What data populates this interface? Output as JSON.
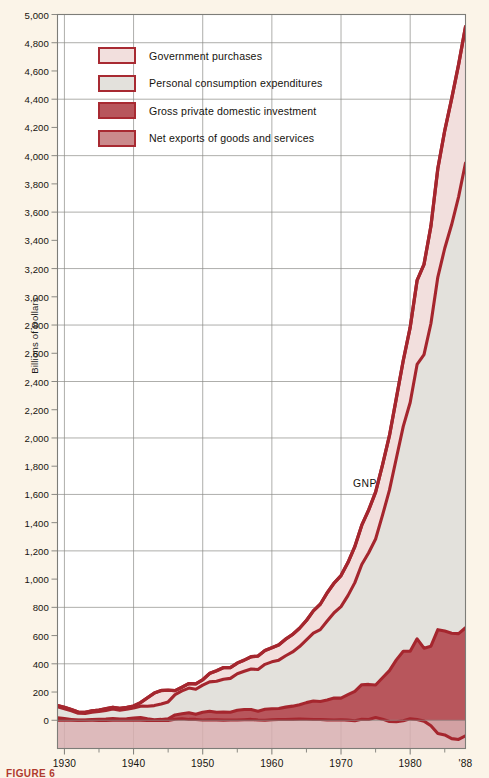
{
  "figure": {
    "caption": "FIGURE 6",
    "background_color": "#fbf4e8",
    "plot_background_color": "#ffffff"
  },
  "legend": {
    "items": [
      {
        "label": "Government purchases",
        "fill": "#f2dfdd",
        "border": "#a82a32"
      },
      {
        "label": "Personal consumption expenditures",
        "fill": "#e3e1dc",
        "border": "#a82a32"
      },
      {
        "label": "Gross private domestic investment",
        "fill": "#b8565c",
        "border": "#a82a32"
      },
      {
        "label": "Net exports of goods and services",
        "fill": "#cb8a8c",
        "border": "#a82a32"
      }
    ]
  },
  "annotations": [
    {
      "name": "gnp-label",
      "text": "GNP",
      "x": 353,
      "y": 478
    }
  ],
  "chart_data": {
    "type": "area",
    "title": "",
    "subtitle": "",
    "xlabel": "",
    "ylabel": "Billions of Dollars",
    "xlim": [
      1929,
      1988
    ],
    "ylim": [
      -200,
      5000
    ],
    "grid": true,
    "legend_position": "inside-top-left",
    "y_ticks": [
      0,
      200,
      400,
      600,
      800,
      1000,
      1200,
      1400,
      1600,
      1800,
      2000,
      2200,
      2400,
      2600,
      2800,
      3000,
      3200,
      3400,
      3600,
      3800,
      4000,
      4200,
      4400,
      4600,
      4800,
      5000
    ],
    "y_tick_labels": [
      "0",
      "200",
      "400",
      "600",
      "800",
      "1,000",
      "1,200",
      "1,400",
      "1,600",
      "1,800",
      "2,000",
      "2,200",
      "2,400",
      "2,600",
      "2,800",
      "3,000",
      "3,200",
      "3,400",
      "3,600",
      "3,800",
      "4,000",
      "4,200",
      "4,400",
      "4,600",
      "4,800",
      "5,000"
    ],
    "x_ticks": [
      1930,
      1940,
      1950,
      1960,
      1970,
      1980,
      1988
    ],
    "x_tick_labels": [
      "1930",
      "1940",
      "1950",
      "1960",
      "1970",
      "1980",
      "'88"
    ],
    "x_minor_ticks": [
      1935,
      1945,
      1955,
      1965,
      1975,
      1985
    ],
    "x": [
      1929,
      1930,
      1931,
      1932,
      1933,
      1934,
      1935,
      1936,
      1937,
      1938,
      1939,
      1940,
      1941,
      1942,
      1943,
      1944,
      1945,
      1946,
      1947,
      1948,
      1949,
      1950,
      1951,
      1952,
      1953,
      1954,
      1955,
      1956,
      1957,
      1958,
      1959,
      1960,
      1961,
      1962,
      1963,
      1964,
      1965,
      1966,
      1967,
      1968,
      1969,
      1970,
      1971,
      1972,
      1973,
      1974,
      1975,
      1976,
      1977,
      1978,
      1979,
      1980,
      1981,
      1982,
      1983,
      1984,
      1985,
      1986,
      1987,
      1988
    ],
    "series": [
      {
        "name": "Net exports of goods and services",
        "order": 1,
        "fill": "#cb8a8c",
        "line": "#a5262e",
        "values": [
          1,
          1,
          0,
          0,
          0,
          1,
          -1,
          -1,
          1,
          1,
          1,
          2,
          1,
          -1,
          -2,
          -2,
          -1,
          7,
          11,
          6,
          6,
          2,
          4,
          3,
          1,
          2,
          2,
          4,
          6,
          2,
          0,
          4,
          5,
          5,
          6,
          8,
          7,
          5,
          5,
          3,
          2,
          4,
          1,
          -3,
          7,
          5,
          20,
          8,
          -9,
          -10,
          -4,
          10,
          5,
          -6,
          -39,
          -94,
          -104,
          -130,
          -136,
          -110
        ]
      },
      {
        "name": "Gross private domestic investment",
        "order": 2,
        "fill": "#b8565c",
        "line": "#a5262e",
        "values": [
          17,
          11,
          6,
          1,
          2,
          4,
          7,
          9,
          12,
          7,
          10,
          14,
          18,
          11,
          6,
          8,
          11,
          31,
          35,
          47,
          36,
          55,
          60,
          54,
          57,
          55,
          69,
          72,
          70,
          62,
          78,
          78,
          78,
          88,
          94,
          102,
          118,
          131,
          128,
          141,
          156,
          153,
          180,
          208,
          245,
          249,
          230,
          293,
          361,
          438,
          493,
          479,
          572,
          517,
          564,
          736,
          736,
          747,
          750,
          765
        ]
      },
      {
        "name": "Personal consumption expenditures",
        "order": 3,
        "fill": "#e3e1dc",
        "line": "#a5262e",
        "values": [
          77,
          70,
          61,
          49,
          46,
          52,
          56,
          62,
          67,
          64,
          67,
          71,
          81,
          89,
          100,
          109,
          120,
          144,
          162,
          175,
          178,
          192,
          208,
          219,
          233,
          240,
          259,
          271,
          287,
          296,
          318,
          332,
          343,
          364,
          384,
          412,
          444,
          481,
          509,
          559,
          604,
          648,
          702,
          770,
          852,
          933,
          1034,
          1152,
          1278,
          1428,
          1593,
          1762,
          1944,
          2079,
          2286,
          2498,
          2712,
          2895,
          3094,
          3293
        ]
      },
      {
        "name": "Government purchases",
        "order": 4,
        "fill": "#f2dfdd",
        "line": "#a5262e",
        "values": [
          9,
          10,
          9,
          8,
          8,
          10,
          10,
          12,
          12,
          13,
          13,
          14,
          25,
          60,
          89,
          96,
          83,
          28,
          26,
          32,
          38,
          38,
          60,
          75,
          82,
          76,
          75,
          79,
          87,
          95,
          98,
          100,
          108,
          118,
          124,
          130,
          138,
          158,
          180,
          200,
          210,
          220,
          234,
          256,
          278,
          303,
          332,
          357,
          386,
          426,
          467,
          532,
          595,
          640,
          690,
          769,
          834,
          892,
          937,
          965
        ]
      }
    ],
    "total_series": {
      "name": "GNP",
      "line": "#a5262e",
      "values": [
        104,
        92,
        76,
        58,
        56,
        67,
        72,
        82,
        92,
        85,
        91,
        101,
        125,
        159,
        193,
        211,
        213,
        210,
        234,
        260,
        258,
        287,
        332,
        351,
        373,
        373,
        405,
        426,
        450,
        455,
        494,
        514,
        534,
        575,
        608,
        652,
        707,
        775,
        822,
        903,
        972,
        1025,
        1117,
        1231,
        1382,
        1490,
        1616,
        1810,
        2016,
        2282,
        2549,
        2783,
        3116,
        3230,
        3501,
        3909,
        4178,
        4404,
        4645,
        4913
      ]
    }
  }
}
